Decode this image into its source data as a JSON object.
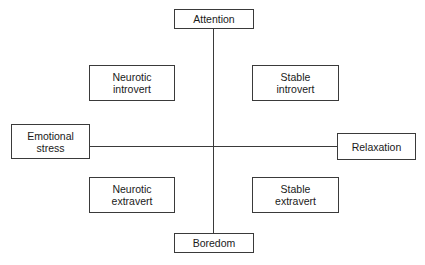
{
  "diagram": {
    "type": "quadrant",
    "axes": {
      "vertical": {
        "top": "Attention",
        "bottom": "Boredom"
      },
      "horizontal": {
        "left": "Emotional\nstress",
        "right": "Relaxation"
      }
    },
    "quadrants": {
      "top_left": "Neurotic\nintrovert",
      "top_right": "Stable\nintrovert",
      "bottom_left": "Neurotic\nextravert",
      "bottom_right": "Stable\nextravert"
    },
    "colors": {
      "line": "#3a3a3a",
      "text": "#1a1a1a",
      "background": "#ffffff"
    }
  }
}
